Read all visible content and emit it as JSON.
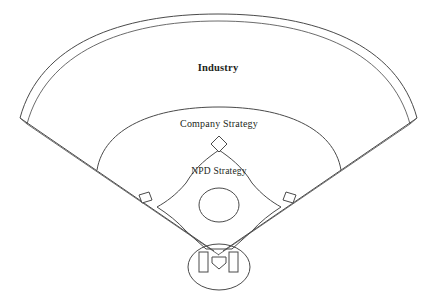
{
  "diagram": {
    "type": "nested-zone-diagram",
    "background_color": "#ffffff",
    "line_color": "#4a4a4a",
    "text_color": "#231f20",
    "zones": [
      {
        "id": "industry",
        "label": "Industry",
        "region": "outfield",
        "emphasis": "bold",
        "label_x": 218,
        "label_y": 69
      },
      {
        "id": "company-strategy",
        "label": "Company Strategy",
        "region": "infield-grass",
        "emphasis": "regular",
        "label_x": 219,
        "label_y": 124
      },
      {
        "id": "npd-strategy",
        "label": "NPD Strategy",
        "region": "infield-dirt",
        "emphasis": "regular",
        "label_x": 219,
        "label_y": 172
      }
    ],
    "features": [
      {
        "id": "outfield-fence",
        "name": "outfield-fence-arc"
      },
      {
        "id": "warning-track",
        "name": "warning-track-band"
      },
      {
        "id": "foul-line-left",
        "name": "left-foul-line"
      },
      {
        "id": "foul-line-right",
        "name": "right-foul-line"
      },
      {
        "id": "infield-arc",
        "name": "infield-grass-arc"
      },
      {
        "id": "infield-dirt",
        "name": "infield-dirt-diamond"
      },
      {
        "id": "pitchers-mound",
        "name": "pitchers-mound-circle"
      },
      {
        "id": "second-base",
        "name": "second-base-diamond"
      },
      {
        "id": "first-base",
        "name": "first-base-square"
      },
      {
        "id": "third-base",
        "name": "third-base-square"
      },
      {
        "id": "home-plate-circle",
        "name": "home-plate-dirt-circle"
      },
      {
        "id": "home-plate",
        "name": "home-plate-pentagon"
      },
      {
        "id": "batters-box-left",
        "name": "left-batters-box"
      },
      {
        "id": "batters-box-right",
        "name": "right-batters-box"
      }
    ]
  }
}
